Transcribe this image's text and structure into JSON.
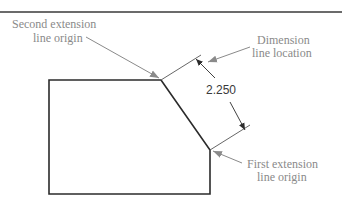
{
  "diagram": {
    "type": "dimensioning-illustration",
    "dimension_value": "2.250",
    "callouts": {
      "second_extension": {
        "line1": "Second extension",
        "line2": "line origin"
      },
      "dimension_line": {
        "line1": "Dimension",
        "line2": "line location"
      },
      "first_extension": {
        "line1": "First extension",
        "line2": "line origin"
      }
    },
    "colors": {
      "outline": "#2b2b2b",
      "leader": "#8a8a8a",
      "label_text": "#8a8a8a",
      "dimension_text": "#3a3a3a",
      "top_rule": "#3a3a3a"
    }
  }
}
